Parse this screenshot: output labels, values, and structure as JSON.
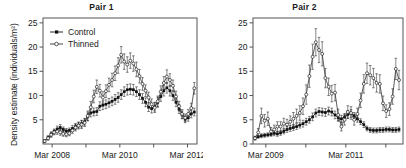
{
  "figure": {
    "panels": [
      {
        "id": "pair-1",
        "title": "Pair 1",
        "ylabel": "Density estimate (individuals/m²)",
        "xlabel": ""
      },
      {
        "id": "pair-2",
        "title": "Pair 2",
        "ylabel": "Density estimate (individuals/m²)",
        "xlabel": ""
      }
    ],
    "legend": {
      "position": "top-left",
      "entries": [
        {
          "label": "Control",
          "marker": "filled-square-icon",
          "color": "#111111"
        },
        {
          "label": "Thinned",
          "marker": "open-circle-icon",
          "color": "#333333"
        }
      ]
    }
  },
  "chart_data": [
    {
      "type": "line",
      "title": "Pair 1",
      "xlabel": "",
      "ylabel": "Density estimate (individuals/m²)",
      "grid": false,
      "legend_position": "top-left",
      "error_bars": true,
      "ylim": [
        0,
        26
      ],
      "yticks": [
        5,
        10,
        15,
        20,
        25
      ],
      "ytick_labels": [
        "5",
        "10",
        "15",
        "20",
        "25"
      ],
      "xlim": [
        2007.9,
        2012.45
      ],
      "xticks": [
        2008.17,
        2009.17,
        2010.17,
        2011.17,
        2012.17
      ],
      "xtick_labels": [
        "Mar 2008",
        "",
        "Mar 2010",
        "",
        "Mar 2012"
      ],
      "x": [
        2007.95,
        2008.05,
        2008.14,
        2008.23,
        2008.32,
        2008.41,
        2008.5,
        2008.59,
        2008.68,
        2008.77,
        2008.86,
        2008.95,
        2009.04,
        2009.13,
        2009.22,
        2009.31,
        2009.4,
        2009.49,
        2009.58,
        2009.67,
        2009.76,
        2009.85,
        2009.94,
        2010.03,
        2010.12,
        2010.21,
        2010.3,
        2010.39,
        2010.48,
        2010.57,
        2010.66,
        2010.75,
        2010.84,
        2010.93,
        2011.02,
        2011.11,
        2011.2,
        2011.29,
        2011.38,
        2011.47,
        2011.56,
        2011.65,
        2011.74,
        2011.83,
        2011.92,
        2012.01,
        2012.1,
        2012.19,
        2012.28,
        2012.37
      ],
      "series": [
        {
          "name": "Control",
          "marker": "filled-square",
          "values": [
            0.6,
            1.3,
            2.0,
            2.6,
            3.1,
            3.4,
            3.0,
            2.7,
            2.8,
            3.2,
            3.6,
            3.9,
            4.2,
            4.6,
            5.6,
            6.4,
            6.6,
            6.7,
            7.8,
            8.0,
            8.2,
            8.5,
            8.8,
            9.2,
            9.6,
            10.2,
            10.8,
            11.2,
            11.3,
            11.2,
            10.8,
            10.2,
            9.4,
            8.6,
            7.6,
            7.3,
            7.7,
            8.6,
            9.8,
            11.0,
            11.6,
            11.0,
            10.0,
            8.6,
            7.2,
            6.0,
            5.1,
            5.4,
            6.2,
            6.6
          ],
          "errors": [
            0.3,
            0.4,
            0.5,
            0.5,
            0.6,
            0.6,
            0.5,
            0.5,
            0.5,
            0.6,
            0.6,
            0.6,
            0.7,
            0.7,
            0.8,
            0.8,
            0.8,
            0.8,
            0.9,
            0.9,
            0.9,
            0.9,
            0.9,
            1.0,
            1.0,
            1.0,
            1.0,
            1.1,
            1.1,
            1.1,
            1.0,
            1.0,
            1.0,
            0.9,
            0.9,
            0.9,
            0.9,
            1.0,
            1.0,
            1.1,
            1.1,
            1.1,
            1.0,
            0.9,
            0.9,
            0.8,
            0.7,
            0.7,
            0.8,
            0.8
          ]
        },
        {
          "name": "Thinned",
          "marker": "open-circle",
          "values": [
            0.6,
            1.2,
            1.9,
            2.4,
            2.6,
            2.4,
            2.1,
            2.0,
            2.2,
            2.8,
            3.4,
            3.8,
            4.0,
            4.4,
            5.8,
            7.6,
            9.8,
            11.8,
            11.0,
            9.6,
            10.9,
            12.2,
            13.2,
            14.6,
            16.2,
            18.4,
            17.0,
            16.4,
            17.2,
            16.6,
            15.4,
            14.0,
            12.4,
            11.0,
            9.6,
            8.2,
            7.5,
            8.8,
            10.8,
            12.6,
            13.9,
            13.2,
            12.0,
            9.8,
            7.8,
            6.2,
            5.4,
            6.2,
            7.4,
            11.5
          ],
          "errors": [
            0.3,
            0.4,
            0.5,
            0.5,
            0.6,
            0.6,
            0.5,
            0.5,
            0.5,
            0.6,
            0.7,
            0.7,
            0.8,
            0.8,
            1.0,
            1.2,
            1.3,
            1.4,
            1.3,
            1.2,
            1.3,
            1.4,
            1.4,
            1.5,
            1.6,
            1.7,
            1.6,
            1.6,
            1.6,
            1.6,
            1.5,
            1.4,
            1.3,
            1.2,
            1.1,
            1.1,
            1.0,
            1.1,
            1.2,
            1.3,
            1.4,
            1.3,
            1.2,
            1.1,
            1.0,
            0.9,
            0.8,
            0.9,
            1.0,
            1.2
          ]
        }
      ]
    },
    {
      "type": "line",
      "title": "Pair 2",
      "xlabel": "",
      "ylabel": "Density estimate (individuals/m²)",
      "grid": false,
      "legend_position": "none",
      "error_bars": true,
      "ylim": [
        0,
        26
      ],
      "yticks": [
        0,
        5,
        10,
        15,
        20,
        25
      ],
      "ytick_labels": [
        "0",
        "5",
        "10",
        "15",
        "20",
        "25"
      ],
      "xlim": [
        2008.85,
        2012.6
      ],
      "xticks": [
        2009.17,
        2010.17,
        2011.17,
        2012.17
      ],
      "xtick_labels": [
        "Mar 2009",
        "",
        "Mar 2011",
        ""
      ],
      "x": [
        2008.9,
        2008.98,
        2009.06,
        2009.14,
        2009.22,
        2009.3,
        2009.38,
        2009.46,
        2009.54,
        2009.62,
        2009.7,
        2009.78,
        2009.86,
        2009.94,
        2010.02,
        2010.1,
        2010.18,
        2010.26,
        2010.34,
        2010.42,
        2010.5,
        2010.58,
        2010.66,
        2010.74,
        2010.82,
        2010.9,
        2010.98,
        2011.06,
        2011.14,
        2011.22,
        2011.3,
        2011.38,
        2011.46,
        2011.54,
        2011.62,
        2011.7,
        2011.78,
        2011.86,
        2011.94,
        2012.02,
        2012.1,
        2012.18,
        2012.26,
        2012.34,
        2012.42,
        2012.5
      ],
      "series": [
        {
          "name": "Control",
          "marker": "filled-square",
          "values": [
            1.2,
            1.5,
            1.7,
            1.8,
            1.9,
            2.0,
            2.2,
            2.1,
            2.3,
            2.6,
            3.0,
            3.2,
            3.4,
            3.6,
            3.9,
            4.2,
            4.6,
            5.0,
            5.6,
            6.4,
            6.7,
            6.6,
            6.5,
            6.8,
            6.6,
            6.0,
            5.4,
            5.2,
            5.6,
            6.1,
            6.3,
            5.8,
            5.2,
            4.6,
            4.0,
            3.2,
            2.9,
            2.8,
            2.8,
            2.9,
            2.9,
            3.0,
            3.0,
            2.9,
            2.9,
            3.0
          ],
          "errors": [
            0.3,
            0.3,
            0.4,
            0.4,
            0.4,
            0.4,
            0.5,
            0.5,
            0.5,
            0.5,
            0.6,
            0.6,
            0.6,
            0.6,
            0.6,
            0.7,
            0.7,
            0.7,
            0.8,
            0.8,
            0.8,
            0.8,
            0.8,
            0.8,
            0.8,
            0.8,
            0.7,
            0.7,
            0.7,
            0.8,
            0.8,
            0.7,
            0.7,
            0.6,
            0.6,
            0.5,
            0.5,
            0.5,
            0.5,
            0.5,
            0.5,
            0.5,
            0.5,
            0.5,
            0.5,
            0.5
          ]
        },
        {
          "name": "Thinned",
          "marker": "open-circle",
          "values": [
            1.2,
            2.4,
            5.8,
            4.8,
            5.2,
            2.6,
            3.0,
            3.6,
            3.6,
            4.2,
            4.0,
            4.6,
            5.2,
            5.8,
            6.4,
            7.8,
            10.2,
            14.0,
            18.0,
            21.0,
            19.4,
            18.6,
            13.6,
            11.8,
            10.4,
            10.6,
            6.0,
            3.6,
            5.0,
            6.6,
            6.4,
            5.0,
            6.2,
            9.0,
            12.4,
            14.6,
            14.2,
            13.6,
            12.6,
            12.4,
            8.4,
            6.8,
            7.2,
            9.8,
            15.5,
            13.2
          ],
          "errors": [
            0.4,
            0.8,
            1.6,
            1.3,
            1.4,
            0.8,
            0.9,
            1.0,
            1.0,
            1.1,
            1.1,
            1.2,
            1.3,
            1.4,
            1.5,
            1.7,
            2.0,
            2.3,
            2.6,
            2.8,
            2.6,
            2.5,
            2.0,
            1.8,
            1.7,
            1.7,
            1.2,
            0.9,
            1.1,
            1.3,
            1.3,
            1.1,
            1.2,
            1.5,
            1.9,
            2.1,
            2.0,
            2.0,
            1.9,
            1.9,
            1.5,
            1.3,
            1.3,
            1.6,
            2.2,
            2.0
          ]
        }
      ]
    }
  ]
}
